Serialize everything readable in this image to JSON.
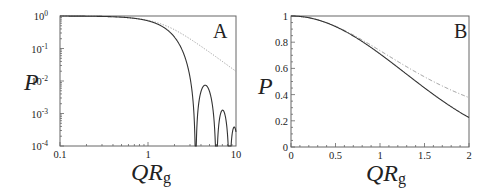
{
  "chart_data": [
    {
      "panel": "A",
      "type": "line",
      "xscale": "log",
      "yscale": "log",
      "xlim": [
        0.1,
        10
      ],
      "ylim": [
        0.0001,
        1
      ],
      "xticks": [
        "0.1",
        "1",
        "10"
      ],
      "yticks": [
        "10^0",
        "10^-1",
        "10^-2",
        "10^-3",
        "10^-4"
      ],
      "xlabel": "QR_g",
      "ylabel": "P",
      "grid": false,
      "series": [
        {
          "name": "solid (sphere form factor)",
          "style": "solid",
          "x": [
            0.1,
            0.3,
            0.5,
            1.0,
            1.5,
            2.0,
            2.5,
            3.0,
            3.48,
            4.0,
            4.5,
            5.0,
            6.0,
            7.0,
            8.0,
            9.0,
            10.0
          ],
          "values": [
            0.997,
            0.97,
            0.92,
            0.711,
            0.47,
            0.217,
            0.08,
            0.018,
            0.0001,
            0.0035,
            0.0068,
            0.0035,
            0.0001,
            0.0012,
            0.0002,
            0.0001,
            0.0003
          ]
        },
        {
          "name": "dotted (Debye)",
          "style": "dotted",
          "x": [
            0.1,
            0.3,
            0.5,
            1.0,
            1.5,
            2.0,
            3.0,
            5.0,
            7.0,
            10.0
          ],
          "values": [
            0.997,
            0.971,
            0.922,
            0.736,
            0.534,
            0.377,
            0.2,
            0.077,
            0.04,
            0.02
          ]
        }
      ],
      "annotation": "A"
    },
    {
      "panel": "B",
      "type": "line",
      "xscale": "linear",
      "yscale": "linear",
      "xlim": [
        0,
        2
      ],
      "ylim": [
        0,
        1
      ],
      "xticks": [
        "0",
        "0.5",
        "1",
        "1.5",
        "2"
      ],
      "yticks": [
        "0",
        "0.2",
        "0.4",
        "0.6",
        "0.8",
        "1"
      ],
      "xlabel": "QR_g",
      "ylabel": "P",
      "grid": false,
      "series": [
        {
          "name": "solid (sphere form factor)",
          "style": "solid",
          "x": [
            0,
            0.25,
            0.5,
            0.75,
            1.0,
            1.25,
            1.5,
            1.75,
            2.0
          ],
          "values": [
            1.0,
            0.979,
            0.92,
            0.829,
            0.711,
            0.59,
            0.47,
            0.345,
            0.217
          ]
        },
        {
          "name": "dashed (Debye)",
          "style": "dashed",
          "x": [
            0,
            0.25,
            0.5,
            0.75,
            1.0,
            1.25,
            1.5,
            1.75,
            2.0
          ],
          "values": [
            1.0,
            0.979,
            0.922,
            0.838,
            0.736,
            0.632,
            0.534,
            0.449,
            0.377
          ]
        }
      ],
      "annotation": "B"
    }
  ],
  "labels": {
    "panelA": {
      "letter": "A",
      "ylabel": "P",
      "xlabel_main": "QR",
      "xlabel_sub": "g",
      "xticks": [
        {
          "v": 0.1,
          "t": "0.1"
        },
        {
          "v": 1,
          "t": "1"
        },
        {
          "v": 10,
          "t": "10"
        }
      ],
      "yticks": [
        {
          "e": 0,
          "t": "10",
          "s": "0"
        },
        {
          "e": -1,
          "t": "10",
          "s": "-1"
        },
        {
          "e": -2,
          "t": "10",
          "s": "-2"
        },
        {
          "e": -3,
          "t": "10",
          "s": "-3"
        },
        {
          "e": -4,
          "t": "10",
          "s": "-4"
        }
      ]
    },
    "panelB": {
      "letter": "B",
      "ylabel": "P",
      "xlabel_main": "QR",
      "xlabel_sub": "g",
      "xticks": [
        {
          "v": 0,
          "t": "0"
        },
        {
          "v": 0.5,
          "t": "0.5"
        },
        {
          "v": 1,
          "t": "1"
        },
        {
          "v": 1.5,
          "t": "1.5"
        },
        {
          "v": 2,
          "t": "2"
        }
      ],
      "yticks": [
        {
          "v": 0,
          "t": "0"
        },
        {
          "v": 0.2,
          "t": "0.2"
        },
        {
          "v": 0.4,
          "t": "0.4"
        },
        {
          "v": 0.6,
          "t": "0.6"
        },
        {
          "v": 0.8,
          "t": "0.8"
        },
        {
          "v": 1,
          "t": "1"
        }
      ]
    }
  },
  "colors": {
    "axis": "#555555",
    "solid": "#333333",
    "dotted": "#888888",
    "text": "#222222"
  }
}
